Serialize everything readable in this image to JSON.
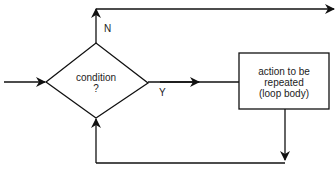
{
  "diagram": {
    "type": "flowchart",
    "nodes": {
      "condition": {
        "line1": "condition",
        "line2": "?"
      },
      "action": {
        "line1": "action to be",
        "line2": "repeated",
        "line3": "(loop body)"
      }
    },
    "edges": {
      "no_label": "N",
      "yes_label": "Y"
    },
    "colors": {
      "stroke": "#111111",
      "background": "#ffffff"
    }
  }
}
